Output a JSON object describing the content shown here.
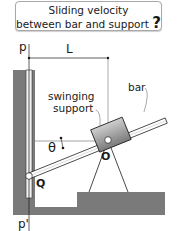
{
  "title": {
    "line1": "Sliding velocity",
    "line2": "between bar and support",
    "question_mark": "?"
  },
  "labels": {
    "p_top": "p",
    "p_bottom": "p'",
    "dimension": "L",
    "support": "swinging",
    "support2": "support",
    "bar": "bar",
    "angle": "θ",
    "pivot_slider": "Q",
    "pivot_support": "O"
  },
  "colors": {
    "ground": "#7a7a7a",
    "block_light": "#d4d4d4",
    "block_dark": "#7f7f7f",
    "line": "#1a1a1a"
  }
}
